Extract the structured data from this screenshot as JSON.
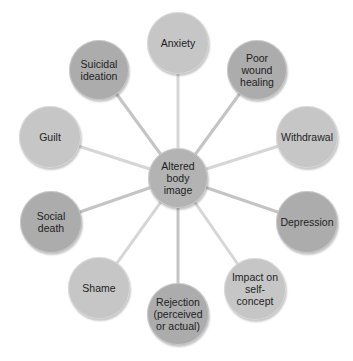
{
  "diagram": {
    "center": {
      "label": "Altered\nbody image",
      "x": 178,
      "y": 178,
      "r": 30,
      "color": "#b3b3b3"
    },
    "nodes": [
      {
        "label": "Anxiety",
        "x": 178,
        "y": 43,
        "r": 31,
        "color": "#c6c6c6",
        "line_color": "#d6d6d6"
      },
      {
        "label": "Poor wound\nhealing",
        "x": 257,
        "y": 70,
        "r": 30,
        "color": "#acacac",
        "line_color": "#c4c4c4"
      },
      {
        "label": "Withdrawal",
        "x": 307,
        "y": 137,
        "r": 31,
        "color": "#c6c6c6",
        "line_color": "#d6d6d6"
      },
      {
        "label": "Depression",
        "x": 307,
        "y": 222,
        "r": 31,
        "color": "#acacac",
        "line_color": "#c4c4c4"
      },
      {
        "label": "Impact on\nself-concept",
        "x": 255,
        "y": 289,
        "r": 31,
        "color": "#c6c6c6",
        "line_color": "#d6d6d6"
      },
      {
        "label": "Rejection\n(perceived\nor actual)",
        "x": 178,
        "y": 314,
        "r": 31,
        "color": "#acacac",
        "line_color": "#c4c4c4"
      },
      {
        "label": "Shame",
        "x": 99,
        "y": 288,
        "r": 31,
        "color": "#c6c6c6",
        "line_color": "#d6d6d6"
      },
      {
        "label": "Social death",
        "x": 51,
        "y": 222,
        "r": 31,
        "color": "#acacac",
        "line_color": "#c4c4c4"
      },
      {
        "label": "Guilt",
        "x": 50,
        "y": 137,
        "r": 31,
        "color": "#c6c6c6",
        "line_color": "#d6d6d6"
      },
      {
        "label": "Suicidal\nideation",
        "x": 99,
        "y": 70,
        "r": 30,
        "color": "#acacac",
        "line_color": "#c4c4c4"
      }
    ]
  }
}
